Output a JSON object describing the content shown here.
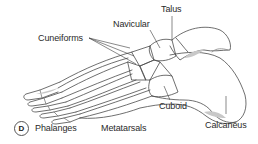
{
  "figure": {
    "panel_letter": "D"
  },
  "labels": {
    "talus": "Talus",
    "navicular": "Navicular",
    "cuneiforms": "Cuneiforms",
    "cuboid": "Cuboid",
    "calcaneus": "Calcaneus",
    "phalanges": "Phalanges",
    "metatarsals": "Metatarsals"
  },
  "colors": {
    "line": "#4a4a4a",
    "shade": "#bdbdbd",
    "text": "#2a2a2a",
    "background": "#ffffff"
  }
}
